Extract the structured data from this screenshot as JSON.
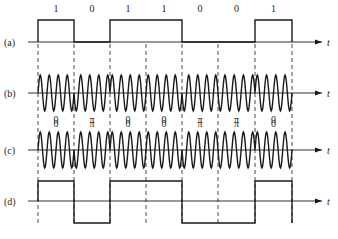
{
  "figure": {
    "bits": [
      "1",
      "0",
      "1",
      "1",
      "0",
      "0",
      "1"
    ],
    "boundaries_x": [
      38,
      74,
      110,
      146,
      182,
      218,
      255,
      292
    ],
    "axis_label": "t",
    "rows": [
      {
        "id": "a",
        "label": "(a)",
        "axis_y": 42,
        "type": "unipolar",
        "high_y": 20
      },
      {
        "id": "b",
        "label": "(b)",
        "axis_y": 93,
        "type": "bpsk",
        "amplitude": 18,
        "phase_labels": [
          "0",
          "π",
          "0",
          "0",
          "π",
          "π",
          "0"
        ],
        "phase_label_y": 127
      },
      {
        "id": "c",
        "label": "(c)",
        "axis_y": 150,
        "type": "dpsk",
        "amplitude": 18,
        "phase_labels": [
          "0",
          "π",
          "0",
          "0",
          "π",
          "π",
          "0"
        ],
        "phase_label_y": 123
      },
      {
        "id": "d",
        "label": "(d)",
        "axis_y": 201,
        "type": "bipolar",
        "high_y": 181,
        "low_y": 223,
        "levels": [
          "high",
          "low",
          "high",
          "high",
          "low",
          "low",
          "high"
        ]
      }
    ],
    "line_color": "#1a1a1a",
    "axis_end_x": 322,
    "axis_start_x": 28,
    "cycles_per_bit": 4
  }
}
